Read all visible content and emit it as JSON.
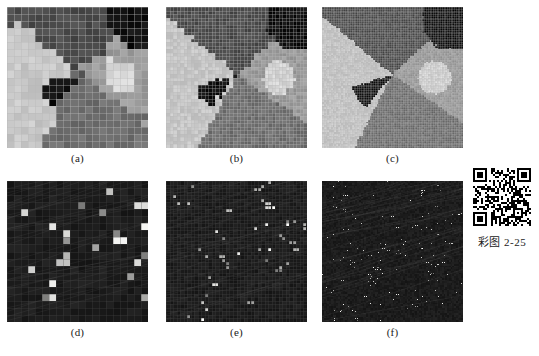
{
  "figure": {
    "caption_bottom": "",
    "panels": [
      {
        "id": "a",
        "label": "(a)",
        "grid": 20,
        "kind": "segmentation-coarse",
        "description": "coarse 20x20 block segmentation map, four grey-level regions plus black wedge"
      },
      {
        "id": "b",
        "label": "(b)",
        "grid": 40,
        "kind": "segmentation-medium",
        "description": "medium 40x40 block segmentation map, four grey-level regions plus black wedge"
      },
      {
        "id": "c",
        "label": "(c)",
        "grid": 80,
        "kind": "segmentation-fine",
        "description": "fine 80x80 block segmentation map, four grey-level regions, black wedge and bright disc"
      },
      {
        "id": "d",
        "label": "(d)",
        "grid": 20,
        "kind": "residual-coarse",
        "description": "dark residual / error map at coarse scale with scattered bright blocks"
      },
      {
        "id": "e",
        "label": "(e)",
        "grid": 40,
        "kind": "residual-medium",
        "description": "dark residual / error map at medium scale with scattered bright blocks"
      },
      {
        "id": "f",
        "label": "(f)",
        "grid": 80,
        "kind": "residual-fine",
        "description": "dark residual / error map at fine scale with scattered bright specks"
      }
    ]
  },
  "qr": {
    "caption": "彩图 2-25",
    "alt": "qr-code"
  },
  "colors": {
    "background": "#ffffff",
    "text": "#1a1a1a",
    "grey_dark": "#4c4c4c",
    "grey_mid": "#6f6f6f",
    "grey_light": "#9b9b9b",
    "grey_pale": "#c8c8c8",
    "black_region": "#101010",
    "residual_bg": "#141414",
    "residual_hot": "#e8e8e8",
    "grid_line": "#b9b9b9"
  }
}
